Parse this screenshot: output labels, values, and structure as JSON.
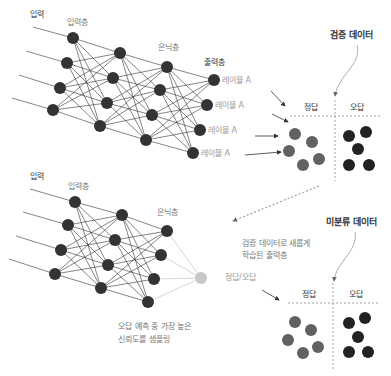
{
  "colors": {
    "node_dark": "#333333",
    "node_grey": "#616161",
    "node_light": "#bdbdbd",
    "edge": "#333333",
    "edge_light": "#cccccc",
    "dashed": "#888888"
  },
  "top_network": {
    "input_label": "입력",
    "input_layer_label": "입력층",
    "hidden_layer_label": "은닉층",
    "output_layer_label": "출력층",
    "output_labels": [
      "레이블 A",
      "레이블 A",
      "레이블 A",
      "레이블 A"
    ]
  },
  "validation_panel": {
    "title": "검증 데이터",
    "correct_label": "정답",
    "wrong_label": "오답",
    "correct_count": 5,
    "wrong_count": 5
  },
  "bottom_network": {
    "input_label": "입력",
    "input_layer_label": "입력층",
    "hidden_layer_label": "은닉층",
    "output_label": "정답/오답",
    "new_output_note_line1": "검증 데이터로 새롭게",
    "new_output_note_line2": "학습된 출력층",
    "sampling_note_line1": "오답 예측 중 가장 높은",
    "sampling_note_line2": "신뢰도를 샘플링"
  },
  "unlabeled_panel": {
    "title": "미분류 데이터",
    "correct_label": "정답",
    "wrong_label": "오답",
    "correct_count": 5,
    "wrong_count": 5
  }
}
